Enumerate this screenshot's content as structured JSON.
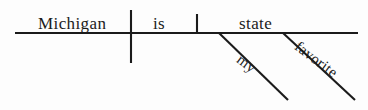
{
  "diagram": {
    "type": "reed-kellogg-sentence-diagram",
    "sentence": "Michigan is my favorite state.",
    "ink_color": "#1b1b1b",
    "background_color": "#fdfdfd",
    "baseline": {
      "x1": 15,
      "y1": 33,
      "x2": 358,
      "y2": 33
    },
    "subject_verb_divider": {
      "x1": 131,
      "y1": 10,
      "x2": 131,
      "y2": 63
    },
    "complement_divider": {
      "x1": 197,
      "y1": 14,
      "x2": 197,
      "y2": 33
    },
    "modifier_lines": [
      {
        "name": "modifier-line-my",
        "x1": 219,
        "y1": 33,
        "x2": 288,
        "y2": 100
      },
      {
        "name": "modifier-line-favorite",
        "x1": 283,
        "y1": 33,
        "x2": 355,
        "y2": 100
      }
    ],
    "words": {
      "subject": "Michigan",
      "verb": "is",
      "complement": "state",
      "modifier_my": "my",
      "modifier_favorite": "favorite"
    }
  }
}
